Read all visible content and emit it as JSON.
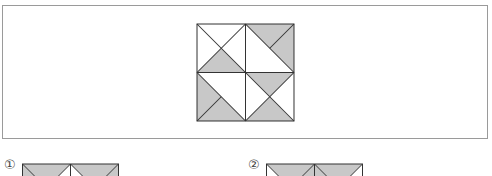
{
  "colors": {
    "shade": "#c8c8c8",
    "line": "#333333",
    "frame": "#9a9a9a"
  },
  "question_figure": {
    "description": "2x2 grid of squares each divided by diagonals into triangles, some shaded gray",
    "quadrants": {
      "top_left": "X diagonals; bottom triangle shaded",
      "top_right": "diagonal TL-BR plus half-diagonal to TR; upper-right region shaded",
      "bottom_left": "diagonal TL-BR plus half-diagonal to BL; lower-left region shaded",
      "bottom_right": "X diagonals; top and bottom triangles shaded"
    }
  },
  "options": [
    {
      "label": "①"
    },
    {
      "label": "②"
    }
  ]
}
